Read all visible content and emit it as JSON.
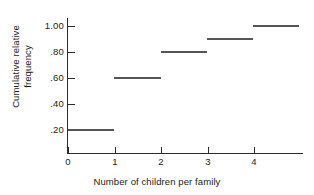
{
  "chart_data": {
    "type": "line",
    "subtype": "step",
    "title": "",
    "xlabel": "Number of children per family",
    "ylabel": "Cumulative relative frequency",
    "ylabel_lines": [
      "Cumulative relative",
      "frequency"
    ],
    "x": [
      0,
      1,
      2,
      3,
      4
    ],
    "values": [
      0.2,
      0.6,
      0.8,
      0.9,
      1.0
    ],
    "categories": [
      "0",
      "1",
      "2",
      "3",
      "4"
    ],
    "steps": [
      {
        "x_start": 0,
        "x_end": 1,
        "y": 0.2,
        "label": ".20"
      },
      {
        "x_start": 1,
        "x_end": 2,
        "y": 0.6,
        "label": ".60"
      },
      {
        "x_start": 2,
        "x_end": 3,
        "y": 0.8,
        "label": ".80"
      },
      {
        "x_start": 3,
        "x_end": 4,
        "y": 0.9,
        "label": ".90"
      },
      {
        "x_start": 4,
        "x_end": 5,
        "y": 1.0,
        "label": "1.00"
      }
    ],
    "xlim": [
      0,
      5.1
    ],
    "ylim": [
      0,
      1.08
    ],
    "xticks": [
      0,
      1,
      2,
      3,
      4
    ],
    "xtick_labels": [
      "0",
      "1",
      "2",
      "3",
      "4"
    ],
    "yticks": [
      0.2,
      0.4,
      0.6,
      0.8,
      1.0
    ],
    "ytick_labels": [
      ".20",
      ".40",
      ".60",
      ".80",
      "1.00"
    ],
    "grid": false,
    "legend": false,
    "series_color": "#555555",
    "axis_color": "#2b2b2b"
  }
}
